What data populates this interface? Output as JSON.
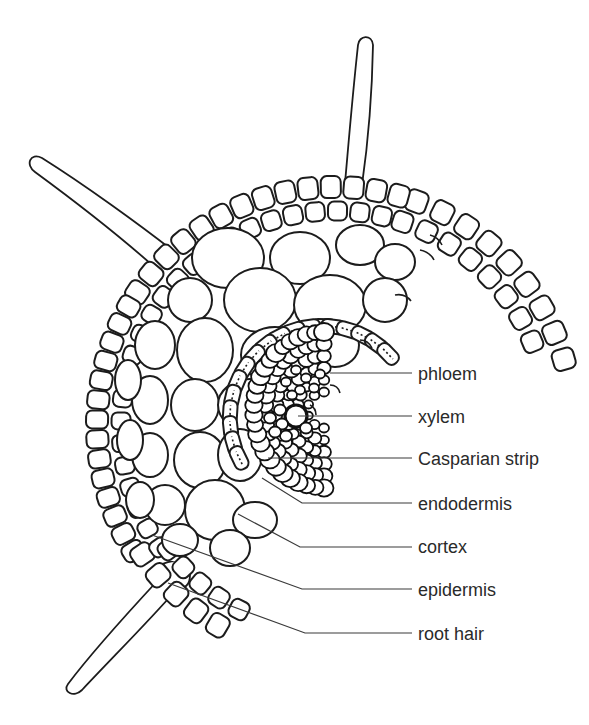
{
  "figure": {
    "colors": {
      "line": "#1c1c1c",
      "label": "#2a2a2a",
      "background": "#ffffff"
    }
  },
  "labels": [
    {
      "id": "phloem",
      "text": "phloem",
      "x": 418,
      "y": 380,
      "leader": [
        [
          330,
          373
        ],
        [
          412,
          373
        ]
      ]
    },
    {
      "id": "xylem",
      "text": "xylem",
      "x": 418,
      "y": 423,
      "leader": [
        [
          298,
          416
        ],
        [
          412,
          416
        ]
      ]
    },
    {
      "id": "casparian-strip",
      "text": "Casparian strip",
      "x": 418,
      "y": 465,
      "leader": [
        [
          268,
          458
        ],
        [
          412,
          458
        ]
      ]
    },
    {
      "id": "endodermis",
      "text": "endodermis",
      "x": 418,
      "y": 510,
      "leader": [
        [
          262,
          478
        ],
        [
          302,
          503
        ],
        [
          412,
          503
        ]
      ]
    },
    {
      "id": "cortex",
      "text": "cortex",
      "x": 418,
      "y": 553,
      "leader": [
        [
          238,
          514
        ],
        [
          300,
          547
        ],
        [
          412,
          547
        ]
      ]
    },
    {
      "id": "epidermis",
      "text": "epidermis",
      "x": 418,
      "y": 596,
      "leader": [
        [
          152,
          535
        ],
        [
          302,
          589
        ],
        [
          412,
          589
        ]
      ]
    },
    {
      "id": "root-hair",
      "text": "root hair",
      "x": 418,
      "y": 640,
      "leader": [
        [
          168,
          583
        ],
        [
          305,
          633
        ],
        [
          412,
          633
        ]
      ]
    }
  ]
}
